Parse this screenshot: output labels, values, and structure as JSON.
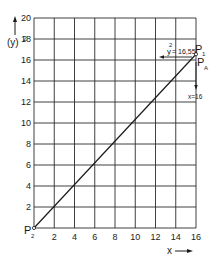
{
  "chart_data": {
    "type": "line",
    "title": "",
    "xlabel": "x",
    "ylabel": "(y)²",
    "xlim": [
      0,
      16
    ],
    "ylim": [
      0,
      20
    ],
    "grid": true,
    "x_ticks": [
      "2",
      "4",
      "6",
      "8",
      "10",
      "12",
      "14",
      "16"
    ],
    "y_ticks": [
      "2",
      "4",
      "6",
      "8",
      "10",
      "12",
      "14",
      "16",
      "18",
      "20"
    ],
    "series": [
      {
        "name": "P2 to P1",
        "x": [
          0,
          16
        ],
        "y": [
          0,
          16.55
        ]
      }
    ],
    "annotations": {
      "p1_label": "P",
      "p1_sub": "1",
      "pa_label": "P",
      "pa_sub": "A",
      "p2_label": "P",
      "p2_sub": "2",
      "y_value_label": "y",
      "y_value_sup": "2",
      "y_value_text": "= 16,55",
      "x_value_label": "x=16"
    }
  },
  "axes": {
    "y_label_base": "(y)",
    "y_label_sup": "2",
    "x_label": "x"
  },
  "colors": {
    "ink": "#1a1a1a",
    "background": "#ffffff"
  }
}
